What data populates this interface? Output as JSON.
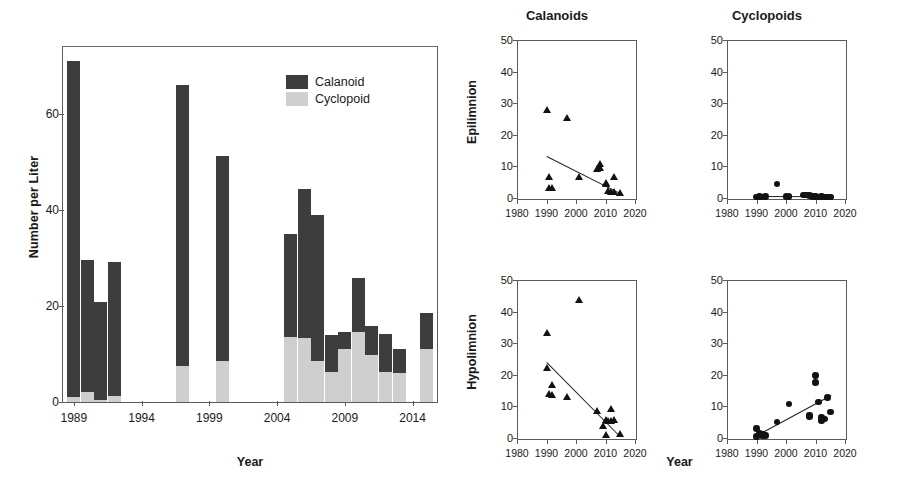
{
  "chart_data": [
    {
      "type": "bar",
      "id": "zooplankton-abundance-stacked-bars",
      "title": "",
      "xlabel": "Year",
      "ylabel": "Number per Liter",
      "stacked": true,
      "grid": false,
      "xlim": [
        1988.2,
        2015.8
      ],
      "ylim": [
        0,
        74
      ],
      "yticks": [
        0,
        20,
        40,
        60
      ],
      "xticks": [
        1989,
        1994,
        1999,
        2004,
        2009,
        2014
      ],
      "legend": [
        "Calanoid",
        "Cyclopoid"
      ],
      "legend_position": "top-right-inside",
      "categories": [
        1989,
        1990,
        1991,
        1992,
        1997,
        2000,
        2005,
        2006,
        2007,
        2008,
        2009,
        2010,
        2011,
        2012,
        2013,
        2015
      ],
      "series": [
        {
          "name": "Cyclopoid",
          "color": "#cfcfcf",
          "values": [
            1.0,
            2.0,
            0.4,
            1.2,
            7.5,
            8.6,
            13.5,
            13.4,
            8.6,
            6.2,
            11.0,
            14.5,
            9.9,
            6.2,
            6.0,
            11.0,
            9.3
          ]
        },
        {
          "name": "Calanoid",
          "color": "#3d3d3d",
          "values": [
            70.0,
            27.5,
            20.4,
            28.0,
            58.5,
            42.7,
            21.5,
            31.0,
            30.3,
            7.8,
            3.5,
            11.3,
            6.0,
            8.0,
            5.0,
            7.5,
            1.2
          ]
        }
      ],
      "totals": [
        71.0,
        29.5,
        20.8,
        29.2,
        66.0,
        51.3,
        35.0,
        44.4,
        38.9,
        14.0,
        14.5,
        25.8,
        15.9,
        14.2,
        11.0,
        18.5,
        10.5
      ]
    },
    {
      "type": "scatter",
      "id": "calanoids-epilimnion",
      "title": "Calanoids",
      "row_label": "Epilimnion",
      "xlabel": "Year",
      "ylabel": "",
      "marker": "triangle",
      "grid": false,
      "xlim": [
        1980,
        2020
      ],
      "ylim": [
        0,
        50
      ],
      "xticks": [
        1980,
        1990,
        2000,
        2010,
        2020
      ],
      "yticks": [
        0,
        10,
        20,
        30,
        40,
        50
      ],
      "points": [
        {
          "x": 1990,
          "y": 27.3
        },
        {
          "x": 1997,
          "y": 24.8
        },
        {
          "x": 1991,
          "y": 6.0
        },
        {
          "x": 2001,
          "y": 5.9
        },
        {
          "x": 1991,
          "y": 2.4
        },
        {
          "x": 1992,
          "y": 2.6
        },
        {
          "x": 2007,
          "y": 8.6
        },
        {
          "x": 2008,
          "y": 10.0
        },
        {
          "x": 2008,
          "y": 9.0
        },
        {
          "x": 2010,
          "y": 4.2
        },
        {
          "x": 2010,
          "y": 3.9
        },
        {
          "x": 2011,
          "y": 1.6
        },
        {
          "x": 2012,
          "y": 1.4
        },
        {
          "x": 2013,
          "y": 1.2
        },
        {
          "x": 2013,
          "y": 6.0
        },
        {
          "x": 2015,
          "y": 1.1
        }
      ],
      "trendline": {
        "x1": 1990,
        "y1": 13.4,
        "x2": 2015,
        "y2": 1.6,
        "direction": "decreasing"
      }
    },
    {
      "type": "scatter",
      "id": "cyclopoids-epilimnion",
      "title": "Cyclopoids",
      "row_label": "Epilimnion",
      "xlabel": "Year",
      "ylabel": "",
      "marker": "circle",
      "grid": false,
      "xlim": [
        1980,
        2020
      ],
      "ylim": [
        0,
        50
      ],
      "xticks": [
        1980,
        1990,
        2000,
        2010,
        2020
      ],
      "yticks": [
        0,
        10,
        20,
        30,
        40,
        50
      ],
      "points": [
        {
          "x": 1997,
          "y": 4.5
        },
        {
          "x": 1990,
          "y": 0.3
        },
        {
          "x": 1991,
          "y": 0.4
        },
        {
          "x": 1992,
          "y": 0.3
        },
        {
          "x": 1993,
          "y": 0.5
        },
        {
          "x": 2000,
          "y": 0.5
        },
        {
          "x": 2001,
          "y": 0.4
        },
        {
          "x": 2006,
          "y": 0.9
        },
        {
          "x": 2007,
          "y": 1.0
        },
        {
          "x": 2008,
          "y": 0.8
        },
        {
          "x": 2009,
          "y": 0.5
        },
        {
          "x": 2010,
          "y": 0.4
        },
        {
          "x": 2011,
          "y": 0.3
        },
        {
          "x": 2012,
          "y": 0.4
        },
        {
          "x": 2013,
          "y": 0.3
        },
        {
          "x": 2014,
          "y": 0.3
        },
        {
          "x": 2015,
          "y": 0.3
        }
      ],
      "trendline": {
        "x1": 1989,
        "y1": 0.5,
        "x2": 2016,
        "y2": 0.4,
        "direction": "flat"
      }
    },
    {
      "type": "scatter",
      "id": "calanoids-hypolimnion",
      "title": "Calanoids",
      "row_label": "Hypolimnion",
      "xlabel": "Year",
      "ylabel": "",
      "marker": "triangle",
      "grid": false,
      "xlim": [
        1980,
        2020
      ],
      "ylim": [
        0,
        50
      ],
      "xticks": [
        1980,
        1990,
        2000,
        2010,
        2020
      ],
      "yticks": [
        0,
        10,
        20,
        30,
        40,
        50
      ],
      "points": [
        {
          "x": 2001,
          "y": 43.0
        },
        {
          "x": 1990,
          "y": 32.5
        },
        {
          "x": 1990,
          "y": 21.5
        },
        {
          "x": 1992,
          "y": 16.0
        },
        {
          "x": 1991,
          "y": 13.3
        },
        {
          "x": 1992,
          "y": 13.0
        },
        {
          "x": 1997,
          "y": 12.2
        },
        {
          "x": 2007,
          "y": 8.0
        },
        {
          "x": 2012,
          "y": 8.6
        },
        {
          "x": 2010,
          "y": 5.0
        },
        {
          "x": 2011,
          "y": 4.8
        },
        {
          "x": 2012,
          "y": 4.6
        },
        {
          "x": 2013,
          "y": 5.0
        },
        {
          "x": 2009,
          "y": 3.2
        },
        {
          "x": 2010,
          "y": 0.3
        },
        {
          "x": 2015,
          "y": 0.5
        }
      ],
      "trendline": {
        "x1": 1990,
        "y1": 24.2,
        "x2": 2015,
        "y2": 0.6,
        "direction": "decreasing"
      }
    },
    {
      "type": "scatter",
      "id": "cyclopoids-hypolimnion",
      "title": "Cyclopoids",
      "row_label": "Hypolimnion",
      "xlabel": "Year",
      "ylabel": "",
      "marker": "circle",
      "grid": false,
      "xlim": [
        1980,
        2020
      ],
      "ylim": [
        0,
        50
      ],
      "xticks": [
        1980,
        1990,
        2000,
        2010,
        2020
      ],
      "yticks": [
        0,
        10,
        20,
        30,
        40,
        50
      ],
      "points": [
        {
          "x": 2010,
          "y": 19.7
        },
        {
          "x": 2010,
          "y": 17.5
        },
        {
          "x": 2014,
          "y": 12.8
        },
        {
          "x": 2011,
          "y": 11.4
        },
        {
          "x": 2001,
          "y": 10.8
        },
        {
          "x": 2015,
          "y": 8.2
        },
        {
          "x": 2008,
          "y": 7.2
        },
        {
          "x": 2008,
          "y": 6.8
        },
        {
          "x": 2012,
          "y": 6.5
        },
        {
          "x": 2013,
          "y": 6.0
        },
        {
          "x": 2012,
          "y": 5.5
        },
        {
          "x": 1997,
          "y": 5.0
        },
        {
          "x": 1990,
          "y": 3.0
        },
        {
          "x": 1991,
          "y": 1.4
        },
        {
          "x": 1992,
          "y": 1.3
        },
        {
          "x": 1990,
          "y": 0.5
        },
        {
          "x": 1992,
          "y": 0.6
        },
        {
          "x": 1993,
          "y": 0.8
        }
      ],
      "trendline": {
        "x1": 1990,
        "y1": 0.8,
        "x2": 2015,
        "y2": 13.4,
        "direction": "increasing"
      }
    }
  ],
  "bar_panel": {
    "ylabel": "Number per Liter",
    "xlabel": "Year",
    "legend": [
      {
        "label": "Calanoid",
        "color": "#3d3d3d"
      },
      {
        "label": "Cyclopoid",
        "color": "#cfcfcf"
      }
    ]
  },
  "scatter_panel": {
    "column_titles": [
      "Calanoids",
      "Cyclopoids"
    ],
    "row_labels": [
      "Epilimnion",
      "Hypolimnion"
    ],
    "xlabel": "Year"
  },
  "colors": {
    "calanoid": "#3d3d3d",
    "cyclopoid": "#cfcfcf",
    "marker": "#121212",
    "axis": "#5b5b5b"
  }
}
